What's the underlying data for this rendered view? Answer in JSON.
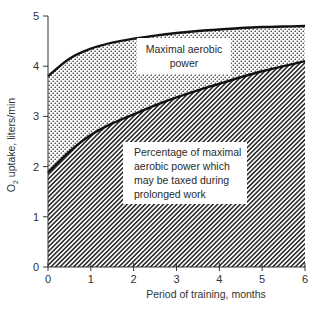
{
  "chart_data": {
    "type": "area",
    "title": "",
    "xlabel": "Period of training, months",
    "ylabel": "O2 uptake, liters/min",
    "ylabel_main": "O",
    "ylabel_sub": "2",
    "ylabel_rest": " uptake, liters/min",
    "xlim": [
      0,
      6
    ],
    "ylim": [
      0,
      5
    ],
    "x_ticks": [
      "0",
      "1",
      "2",
      "3",
      "4",
      "5",
      "6"
    ],
    "y_ticks": [
      "0",
      "1",
      "2",
      "3",
      "4",
      "5"
    ],
    "grid": false,
    "legend": "none (inline annotations)",
    "x": [
      0,
      0.5,
      1,
      1.5,
      2,
      2.5,
      3,
      3.5,
      4,
      4.5,
      5,
      5.5,
      6
    ],
    "series": [
      {
        "name": "Maximal aerobic power",
        "fill": "dotted",
        "values": [
          3.8,
          4.15,
          4.35,
          4.47,
          4.55,
          4.61,
          4.66,
          4.7,
          4.73,
          4.76,
          4.78,
          4.79,
          4.8
        ]
      },
      {
        "name": "Percentage of maximal aerobic power which may be taxed during prolonged work",
        "fill": "hatched",
        "values": [
          1.88,
          2.3,
          2.63,
          2.86,
          3.04,
          3.22,
          3.38,
          3.52,
          3.65,
          3.78,
          3.9,
          4.0,
          4.1
        ]
      }
    ],
    "annotations": [
      {
        "text_lines": [
          "Maximal aerobic",
          "power"
        ],
        "region": "dotted band"
      },
      {
        "text_lines": [
          "Percentage of maximal",
          "aerobic power which",
          "may be taxed during",
          "prolonged work"
        ],
        "region": "hatched area"
      }
    ]
  }
}
